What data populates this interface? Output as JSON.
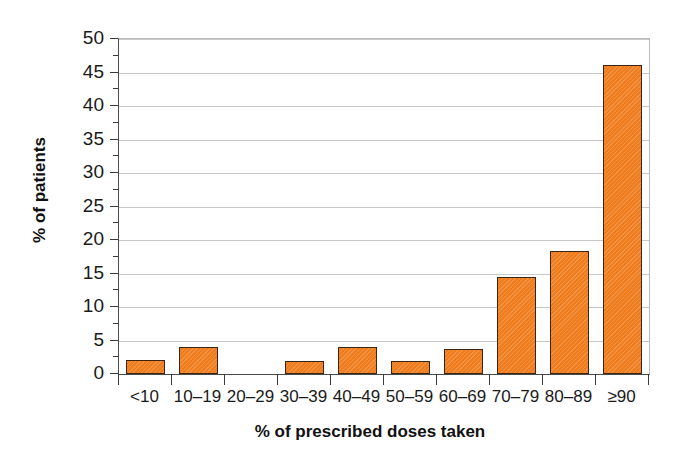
{
  "chart_data": {
    "type": "bar",
    "title": "",
    "subtitle": "",
    "xlabel": "% of prescribed doses taken",
    "ylabel": "% of patients",
    "categories": [
      "<10",
      "10–19",
      "20–29",
      "30–39",
      "40–49",
      "50–59",
      "60–69",
      "70–79",
      "80–89",
      "≥90"
    ],
    "values": [
      2.1,
      4.0,
      0,
      2.0,
      4.0,
      1.9,
      3.8,
      14.5,
      18.4,
      46.1
    ],
    "ylim": [
      0,
      50
    ],
    "ytick_values": [
      0,
      5,
      10,
      15,
      20,
      25,
      30,
      35,
      40,
      45,
      50
    ],
    "ytick_labels": [
      "0",
      "5",
      "10",
      "15",
      "20",
      "25",
      "30",
      "35",
      "40",
      "45",
      "50"
    ],
    "yminor_tick_values": [
      2.5,
      7.5,
      12.5,
      17.5,
      22.5,
      27.5,
      32.5,
      37.5,
      42.5,
      47.5
    ],
    "grid": "horizontal",
    "legend": "none",
    "bar_color": "#ef7d1e",
    "bar_edge_color": "#3b2412",
    "grid_color": "#c7c9cb",
    "axis_color": "#4a4a4a",
    "background_color": "#ffffff"
  }
}
